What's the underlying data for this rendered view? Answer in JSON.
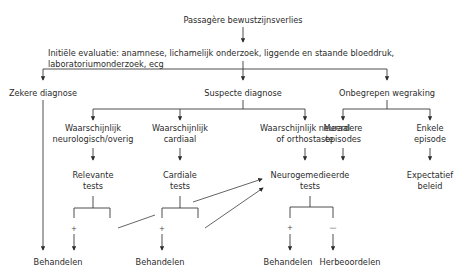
{
  "diagram": {
    "root": "Passagère bewustzijnsverlies",
    "initial_eval": {
      "line1": "Initiële evaluatie: anamnese, lichamelijk onderzoek, liggende en staande bloeddruk,",
      "line2": "laboratoriumonderzoek, ecg"
    },
    "level1": {
      "certain": "Zekere diagnose",
      "suspect": "Suspecte diagnose",
      "unexplained": "Onbegrepen wegraking"
    },
    "suspect_branches": {
      "neuro": {
        "line1": "Waarschijnlijk",
        "line2": "neurologisch/overig"
      },
      "cardiac": {
        "line1": "Waarschijnlijk",
        "line2": "cardiaal"
      },
      "neural": {
        "line1": "Waarschijnlijk neuraal",
        "line2": "of orthostaste"
      }
    },
    "unexplained_branches": {
      "multiple": {
        "line1": "Meerdere",
        "line2": "episodes"
      },
      "single": {
        "line1": "Enkele",
        "line2": "episode"
      }
    },
    "tests": {
      "relevant": {
        "line1": "Relevante",
        "line2": "tests"
      },
      "cardiac": {
        "line1": "Cardiale",
        "line2": "tests"
      },
      "neuro": {
        "line1": "Neurogemedieerde",
        "line2": "tests"
      }
    },
    "expectant": {
      "line1": "Expectatief",
      "line2": "beleid"
    },
    "signs": {
      "positive": "+",
      "negative": "—"
    },
    "outcomes": {
      "treat_certain": "Behandelen",
      "treat_cardiac": "Behandelen",
      "treat_neuro": "Behandelen",
      "reassess": "Herbeoordelen"
    },
    "colors": {
      "line": "#3a3a3a",
      "text": "#2b2b2b",
      "background": "#ffffff"
    }
  }
}
